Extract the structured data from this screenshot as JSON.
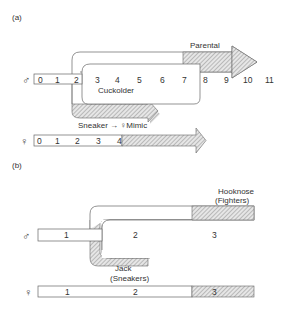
{
  "panel_a": {
    "label": "(a)",
    "male_symbol": "♂",
    "female_symbol": "♀",
    "male_ticks": [
      "0",
      "1",
      "2",
      "3",
      "4",
      "5",
      "6",
      "7",
      "8",
      "9",
      "10",
      "11"
    ],
    "female_ticks": [
      "0",
      "1",
      "2",
      "3",
      "4"
    ],
    "paths": {
      "parental": "Parental",
      "cuckolder": "Cuckolder",
      "sneaker": "Sneaker → ♀Mimic"
    }
  },
  "panel_b": {
    "label": "(b)",
    "male_symbol": "♂",
    "female_symbol": "♀",
    "male_stages": [
      "1",
      "2",
      "3"
    ],
    "female_stages": [
      "1",
      "2",
      "3"
    ],
    "paths": {
      "hooknose_line1": "Hooknose",
      "hooknose_line2": "(Fighters)",
      "jack_line1": "Jack",
      "jack_line2": "(Sneakers)"
    }
  },
  "colors": {
    "line": "#555555",
    "hatch": "#777777",
    "background": "#ffffff"
  }
}
